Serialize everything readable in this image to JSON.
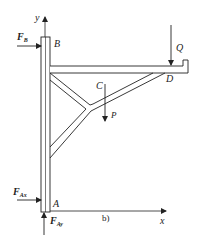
{
  "diagram": {
    "caption": "b)",
    "axes": {
      "x_label": "x",
      "y_label": "y"
    },
    "points": {
      "A": "A",
      "B": "B",
      "C": "C",
      "D": "D"
    },
    "forces": {
      "FB": {
        "main": "F",
        "sub": "B"
      },
      "FAx": {
        "main": "F",
        "sub": "Ax"
      },
      "FAy": {
        "main": "F",
        "sub": "Ay"
      },
      "P": "P",
      "Q": "Q"
    },
    "colors": {
      "line": "#222222",
      "background": "#ffffff"
    }
  }
}
